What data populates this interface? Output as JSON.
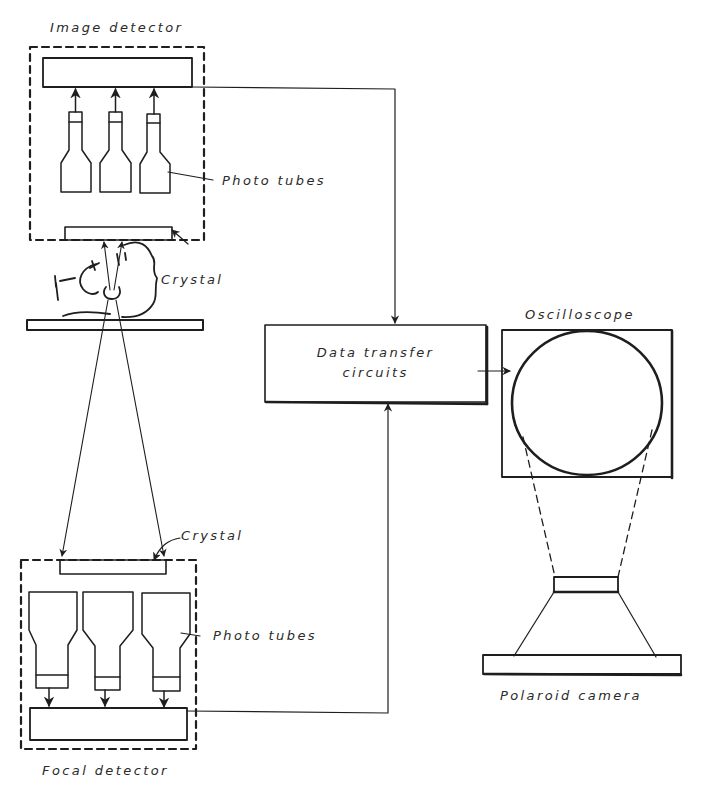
{
  "diagram": {
    "type": "scintillation-camera block diagram",
    "colors": {
      "ink": "#1e1e1e",
      "paper": "#ffffff"
    },
    "labels": {
      "image_detector": "Image detector",
      "photo_tubes_top": "Photo tubes",
      "crystal_top": "Crystal",
      "data_transfer_line1": "Data transfer",
      "data_transfer_line2": "circuits",
      "oscilloscope": "Oscilloscope",
      "crystal_bottom": "Crystal",
      "photo_tubes_bottom": "Photo tubes",
      "focal_detector": "Focal detector",
      "polaroid_camera": "Polaroid camera"
    },
    "components": [
      {
        "id": "image-detector",
        "label": "Image detector",
        "contains": [
          "collector bar",
          "3 photo tubes",
          "crystal"
        ]
      },
      {
        "id": "patient",
        "label": "patient head on table"
      },
      {
        "id": "focal-detector",
        "label": "Focal detector",
        "contains": [
          "crystal",
          "3 photo tubes",
          "collector bar"
        ]
      },
      {
        "id": "data-transfer",
        "label": "Data transfer circuits"
      },
      {
        "id": "oscilloscope",
        "label": "Oscilloscope"
      },
      {
        "id": "camera",
        "label": "Polaroid camera"
      }
    ],
    "connections": [
      {
        "from": "image-detector",
        "to": "data-transfer"
      },
      {
        "from": "focal-detector",
        "to": "data-transfer"
      },
      {
        "from": "data-transfer",
        "to": "oscilloscope"
      },
      {
        "from": "oscilloscope",
        "to": "camera",
        "style": "dashed projection"
      }
    ]
  }
}
